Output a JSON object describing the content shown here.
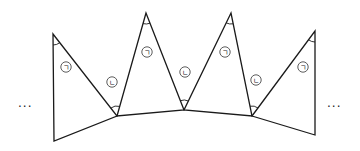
{
  "diagram": {
    "line_color": "#1a1a1a",
    "background": "#ffffff",
    "ellipsis_left": "···",
    "ellipsis_right": "···",
    "labels": {
      "giyeok": "ㄱ",
      "nieun": "ㄴ"
    },
    "triangles": [
      {
        "id": "t1",
        "points": [
          [
            53,
            34
          ],
          [
            54,
            141
          ],
          [
            117,
            116
          ]
        ],
        "marked_vertex": [
          53,
          34
        ],
        "label": "ㄱ",
        "label_pos": [
          66,
          67
        ]
      },
      {
        "id": "t2",
        "points": [
          [
            146,
            13
          ],
          [
            117,
            116
          ],
          [
            184,
            110
          ]
        ],
        "marked_vertex": [
          146,
          13
        ],
        "label": "ㄱ",
        "label_pos": [
          147,
          52
        ]
      },
      {
        "id": "t3",
        "points": [
          [
            231,
            13
          ],
          [
            184,
            110
          ],
          [
            252,
            116
          ]
        ],
        "marked_vertex": [
          231,
          13
        ],
        "label": "ㄱ",
        "label_pos": [
          225,
          52
        ]
      },
      {
        "id": "t4",
        "points": [
          [
            315,
            31
          ],
          [
            315,
            135
          ],
          [
            252,
            116
          ]
        ],
        "marked_vertex": [
          315,
          31
        ],
        "label": "ㄱ",
        "label_pos": [
          303,
          67
        ]
      }
    ],
    "junction_angles": [
      {
        "vertex": [
          117,
          116
        ],
        "label": "ㄴ",
        "label_pos": [
          112,
          82
        ]
      },
      {
        "vertex": [
          184,
          110
        ],
        "label": "ㄴ",
        "label_pos": [
          185,
          72
        ]
      },
      {
        "vertex": [
          252,
          116
        ],
        "label": "ㄴ",
        "label_pos": [
          256,
          80
        ]
      }
    ]
  }
}
